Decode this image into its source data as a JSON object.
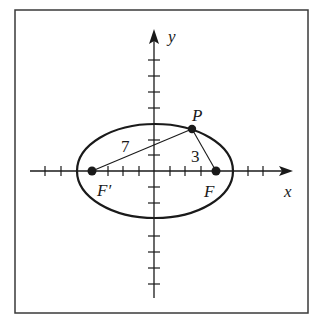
{
  "figure": {
    "type": "ellipse-foci-diagram",
    "axes": {
      "x_label": "x",
      "y_label": "y"
    },
    "points": {
      "P": {
        "label": "P"
      },
      "F": {
        "label": "F"
      },
      "F_prime": {
        "label": "F′"
      }
    },
    "segments": {
      "F_prime_to_P": {
        "length_label": "7"
      },
      "P_to_F": {
        "length_label": "3"
      }
    },
    "colors": {
      "stroke": "#1a1a1a",
      "background": "#ffffff",
      "frame": "#3a3a3a"
    }
  }
}
